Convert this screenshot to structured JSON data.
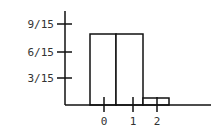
{
  "chart_data": {
    "type": "bar",
    "title": "",
    "xlabel": "",
    "ylabel": "",
    "categories": [
      "bar1",
      "bar2",
      "bar3"
    ],
    "values": [
      0.5333,
      0.5333,
      0.0667
    ],
    "values_fraction": [
      "8/15",
      "8/15",
      "1/15"
    ],
    "x_tick_labels": [
      "0",
      "1",
      "2"
    ],
    "y_tick_labels": [
      "3/15",
      "6/15",
      "9/15"
    ],
    "y_ticks": [
      0.2,
      0.4,
      0.6
    ],
    "ylim": [
      0,
      0.7
    ],
    "grid": false,
    "legend": null
  },
  "axes": {
    "y_ticks": [
      {
        "label": "9/15",
        "y": 24
      },
      {
        "label": "6/15",
        "y": 52
      },
      {
        "label": "3/15",
        "y": 78
      }
    ],
    "x_ticks": [
      {
        "label": "0",
        "x": 104
      },
      {
        "label": "1",
        "x": 133
      },
      {
        "label": "2",
        "x": 157
      }
    ]
  },
  "bars": [
    {
      "x": 90,
      "w": 26,
      "top": 34
    },
    {
      "x": 116,
      "w": 27,
      "top": 34
    },
    {
      "x": 143,
      "w": 26,
      "top": 98
    }
  ]
}
